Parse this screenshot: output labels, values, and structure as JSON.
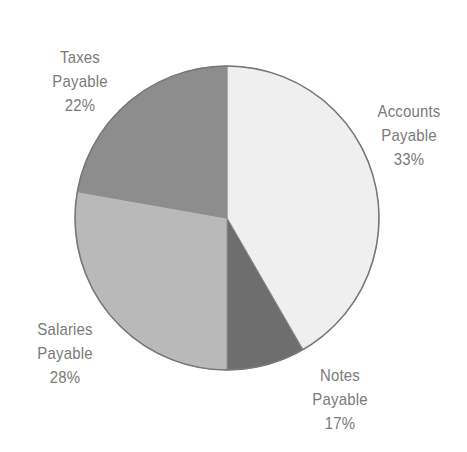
{
  "chart_data": {
    "type": "pie",
    "title": "",
    "slices": [
      {
        "name": "Accounts Payable",
        "line1": "Accounts",
        "line2": "Payable",
        "value": 33,
        "label": "33%",
        "color": "#efefef",
        "start_deg": 0,
        "end_deg": 150
      },
      {
        "name": "Notes Payable",
        "line1": "Notes",
        "line2": "Payable",
        "value": 17,
        "label": "17%",
        "color": "#6e6e6e",
        "start_deg": 150,
        "end_deg": 180
      },
      {
        "name": "Salaries Payable",
        "line1": "Salaries",
        "line2": "Payable",
        "value": 28,
        "label": "28%",
        "color": "#b9b9b9",
        "start_deg": 180,
        "end_deg": 280
      },
      {
        "name": "Taxes Payable",
        "line1": "Taxes",
        "line2": "Payable",
        "value": 22,
        "label": "22%",
        "color": "#8d8d8d",
        "start_deg": 280,
        "end_deg": 360
      }
    ],
    "categories": [
      "Accounts Payable",
      "Notes Payable",
      "Salaries Payable",
      "Taxes Payable"
    ],
    "values": [
      33,
      17,
      28,
      22
    ],
    "unit": "%",
    "legend": "none (direct labels)",
    "outline_color": "#777777"
  }
}
